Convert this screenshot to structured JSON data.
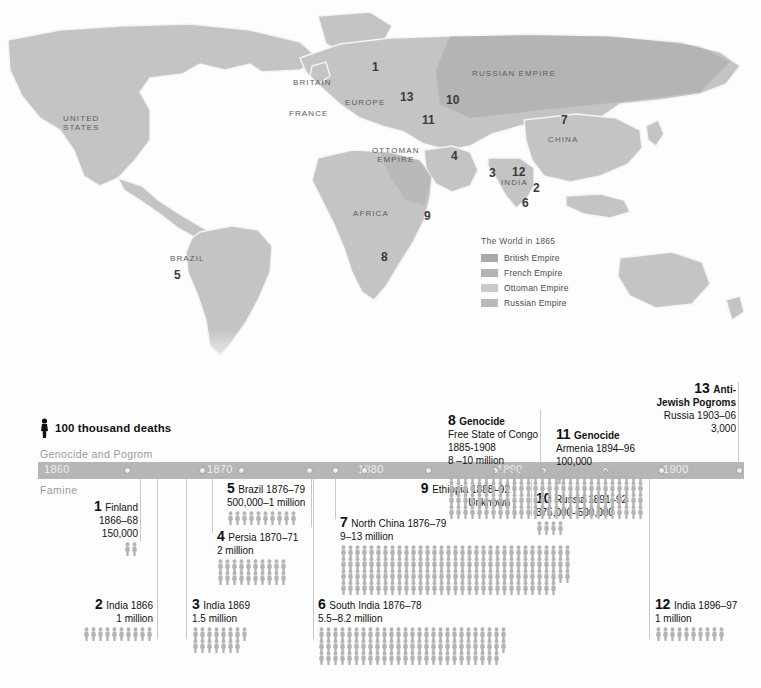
{
  "map": {
    "name": "world-map-1865",
    "labels": [
      {
        "text": "UNITED\nSTATES",
        "x": 63,
        "y": 114
      },
      {
        "text": "BRITAIN",
        "x": 293,
        "y": 78
      },
      {
        "text": "EUROPE",
        "x": 345,
        "y": 98
      },
      {
        "text": "FRANCE",
        "x": 289,
        "y": 109
      },
      {
        "text": "RUSSIAN EMPIRE",
        "x": 472,
        "y": 69
      },
      {
        "text": "CHINA",
        "x": 548,
        "y": 135
      },
      {
        "text": "INDIA",
        "x": 501,
        "y": 178
      },
      {
        "text": "OTTOMAN\nEMPIRE",
        "x": 372,
        "y": 146
      },
      {
        "text": "AFRICA",
        "x": 353,
        "y": 209
      },
      {
        "text": "BRAZIL",
        "x": 170,
        "y": 254
      }
    ],
    "numbers": [
      {
        "n": "1",
        "x": 372,
        "y": 60
      },
      {
        "n": "13",
        "x": 400,
        "y": 90
      },
      {
        "n": "10",
        "x": 446,
        "y": 93
      },
      {
        "n": "11",
        "x": 422,
        "y": 113
      },
      {
        "n": "7",
        "x": 561,
        "y": 113
      },
      {
        "n": "4",
        "x": 451,
        "y": 149
      },
      {
        "n": "3",
        "x": 489,
        "y": 166
      },
      {
        "n": "12",
        "x": 512,
        "y": 165
      },
      {
        "n": "2",
        "x": 533,
        "y": 181
      },
      {
        "n": "6",
        "x": 522,
        "y": 196
      },
      {
        "n": "9",
        "x": 424,
        "y": 209
      },
      {
        "n": "8",
        "x": 381,
        "y": 250
      },
      {
        "n": "5",
        "x": 174,
        "y": 268
      }
    ],
    "legend": {
      "title": "The World in 1865",
      "items": [
        {
          "label": "British Empire",
          "color": "#a9a9a9"
        },
        {
          "label": "French Empire",
          "color": "#b3b3b3"
        },
        {
          "label": "Ottoman Empire",
          "color": "#c9c9c9"
        },
        {
          "label": "Russian Empire",
          "color": "#b9b9b9"
        }
      ]
    }
  },
  "timeline": {
    "key_label": "100 thousand deaths",
    "key_icon": "person-figure-icon",
    "band_above": "Genocide and Pogrom",
    "band_below": "Famine",
    "bar_color": "#b6b6b6",
    "figure_color": "#b3b3b3",
    "years": [
      {
        "label": "1860",
        "x": 44
      },
      {
        "label": "1870",
        "x": 207
      },
      {
        "label": "1880",
        "x": 358
      },
      {
        "label": "1890",
        "x": 497
      },
      {
        "label": "1900",
        "x": 663
      }
    ],
    "ticks": [
      124,
      199,
      238,
      306,
      332,
      361,
      425,
      492,
      540,
      602,
      658,
      736
    ],
    "entries": [
      {
        "id": "1",
        "name": "Finland",
        "dates": "1866–68",
        "toll": "150,000",
        "type": "famine",
        "align": "right",
        "figs": 2,
        "rows": 1,
        "x": 60,
        "y": 130,
        "w": 78,
        "lead": {
          "x": 140,
          "y": 109,
          "h": 62
        }
      },
      {
        "id": "2",
        "name": "India 1866",
        "dates": "",
        "toll": "1 million",
        "type": "famine",
        "align": "right",
        "figs": 10,
        "rows": 1,
        "x": 35,
        "y": 228,
        "w": 118,
        "lead": {
          "x": 157,
          "y": 109,
          "h": 160
        }
      },
      {
        "id": "3",
        "name": "India 1869",
        "dates": "",
        "toll": "1.5 million",
        "type": "famine",
        "align": "left",
        "figs": 15,
        "rows": 2,
        "x": 192,
        "y": 228,
        "w": 110,
        "lead": {
          "x": 186,
          "y": 109,
          "h": 160
        }
      },
      {
        "id": "4",
        "name": "Persia 1870–71",
        "dates": "",
        "toll": "2 million",
        "type": "famine",
        "align": "left",
        "figs": 20,
        "rows": 2,
        "x": 217,
        "y": 160,
        "w": 115,
        "lead": {
          "x": 212,
          "y": 109,
          "h": 54
        }
      },
      {
        "id": "5",
        "name": "Brazil 1876–79",
        "dates": "",
        "toll": "500,000–1 million",
        "type": "famine",
        "align": "left",
        "figs": 10,
        "rows": 1,
        "x": 227,
        "y": 112,
        "w": 103,
        "lead": {
          "x": 311,
          "y": 109,
          "h": 48
        }
      },
      {
        "id": "6",
        "name": "South India  1876–78",
        "dates": "",
        "toll": "5.5–8.2 million",
        "type": "famine",
        "align": "left",
        "figs": 80,
        "rows": 3,
        "x": 318,
        "y": 228,
        "w": 190,
        "lead": {
          "x": 313,
          "y": 109,
          "h": 160
        }
      },
      {
        "id": "7",
        "name": "North China 1876–79",
        "dates": "",
        "toll": "9–13 million",
        "type": "famine",
        "align": "left",
        "figs": 130,
        "rows": 4,
        "x": 340,
        "y": 146,
        "w": 195,
        "lead": {
          "x": 335,
          "y": 109,
          "h": 40
        }
      },
      {
        "id": "9",
        "name": "Ethiopia 1888–92",
        "dates": "",
        "toll": "Unknown",
        "type": "famine",
        "align": "right",
        "figs": 0,
        "rows": 0,
        "x": 395,
        "y": 112,
        "w": 115,
        "lead": {
          "x": 513,
          "y": 109,
          "h": 37
        }
      },
      {
        "id": "10",
        "name": "Russia 1891–92",
        "dates": "",
        "toll": "375,000–500,000",
        "type": "famine",
        "align": "left",
        "figs": 4,
        "rows": 1,
        "x": 536,
        "y": 122,
        "w": 110,
        "lead": {
          "x": 531,
          "y": 109,
          "h": 37
        }
      },
      {
        "id": "12",
        "name": "India 1896–97",
        "dates": "",
        "toll": "1 million",
        "type": "famine",
        "align": "left",
        "figs": 10,
        "rows": 1,
        "x": 655,
        "y": 228,
        "w": 105,
        "lead": {
          "x": 649,
          "y": 109,
          "h": 160
        }
      },
      {
        "id": "8",
        "title": "Genocide",
        "name": "Free State of Congo",
        "dates": "1885-1908",
        "toll": "8 –10 million",
        "type": "genocide",
        "align": "left",
        "figs": 112,
        "rows": 4,
        "x": 448,
        "y": 44,
        "w": 120,
        "lead": null
      },
      {
        "id": "11",
        "title": "Genocide",
        "name": "Armenia 1894–96",
        "dates": "",
        "toll": "100,000",
        "type": "genocide",
        "align": "left",
        "figs": 1,
        "rows": 1,
        "x": 556,
        "y": 58,
        "w": 110,
        "lead": {
          "x": 540,
          "y": 40,
          "h": 52
        }
      },
      {
        "id": "13",
        "title": "Anti-\nJewish Pogroms",
        "name": "Russia 1903–06",
        "dates": "",
        "toll": "3,000",
        "type": "genocide",
        "align": "right",
        "figs": 0,
        "rows": 0,
        "x": 613,
        "y": 12,
        "w": 123,
        "lead": {
          "x": 738,
          "y": 12,
          "h": 80
        }
      }
    ]
  }
}
